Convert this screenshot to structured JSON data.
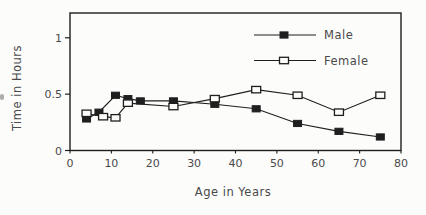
{
  "figure": {
    "background": "#fcfcfb",
    "ink_color": "#1f1f1f",
    "text_color": "#4a4a4a"
  },
  "chart_data": {
    "type": "line",
    "title": "",
    "xlabel": "Age in Years",
    "ylabel": "Time in Hours",
    "xlim": [
      0,
      80
    ],
    "ylim": [
      0,
      1.22
    ],
    "x_ticks": [
      0,
      10,
      20,
      30,
      40,
      50,
      60,
      70,
      80
    ],
    "y_ticks": [
      0,
      0.5,
      1
    ],
    "grid": false,
    "legend_position": "top-right-inside",
    "series": [
      {
        "name": "Male",
        "marker": "filled-square",
        "color": "#1f1f1f",
        "x": [
          4,
          7,
          11,
          14,
          17,
          25,
          35,
          45,
          55,
          65,
          75
        ],
        "y": [
          0.28,
          0.34,
          0.49,
          0.46,
          0.44,
          0.44,
          0.41,
          0.37,
          0.24,
          0.17,
          0.12
        ]
      },
      {
        "name": "Female",
        "marker": "open-square",
        "color": "#1f1f1f",
        "x": [
          4,
          8,
          11,
          14,
          25,
          35,
          45,
          55,
          65,
          75
        ],
        "y": [
          0.33,
          0.3,
          0.29,
          0.42,
          0.39,
          0.46,
          0.54,
          0.49,
          0.34,
          0.49
        ]
      }
    ]
  }
}
